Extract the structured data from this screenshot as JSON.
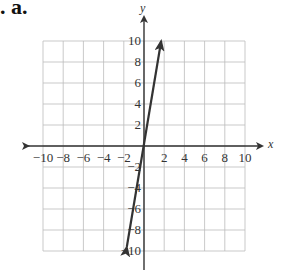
{
  "problem_label": ". a.",
  "chart_data": {
    "type": "line",
    "title": "",
    "xlabel": "x",
    "ylabel": "y",
    "xlim": [
      -10,
      10
    ],
    "ylim": [
      -10,
      10
    ],
    "grid": true,
    "x_ticks": [
      "-10",
      "-8",
      "-6",
      "-4",
      "-2",
      "2",
      "4",
      "6",
      "8",
      "10"
    ],
    "y_ticks_pos": [
      "10",
      "8",
      "6",
      "4",
      "2"
    ],
    "y_ticks_neg": [
      "-2",
      "-4",
      "-6",
      "-8",
      "-10"
    ],
    "series": [
      {
        "name": "line",
        "x": [
          -1.7,
          0,
          1.7
        ],
        "y": [
          -9.6,
          0,
          10
        ],
        "arrows": "both",
        "color": "#333333"
      }
    ]
  }
}
